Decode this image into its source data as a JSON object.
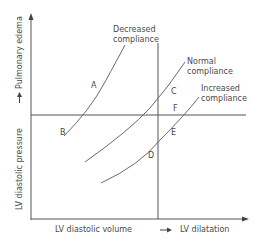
{
  "diagram": {
    "axes": {
      "y_label": "LV diastolic pressure",
      "y_arrow_label": "Pulmonary edema",
      "x_label": "LV diastolic volume",
      "x_arrow_label": "LV dilatation"
    },
    "curves": [
      {
        "name": "decreased-compliance",
        "label_line1": "Decreased",
        "label_line2": "compliance"
      },
      {
        "name": "normal-compliance",
        "label_line1": "Normal",
        "label_line2": "compliance"
      },
      {
        "name": "increased-compliance",
        "label_line1": "Increased",
        "label_line2": "compliance"
      }
    ],
    "points": {
      "A": "A",
      "B": "B",
      "C": "C",
      "D": "D",
      "E": "E",
      "F": "F"
    },
    "colors": {
      "axis": "#555555",
      "curve": "#6a6a6a",
      "text": "#4a4a4a"
    }
  }
}
